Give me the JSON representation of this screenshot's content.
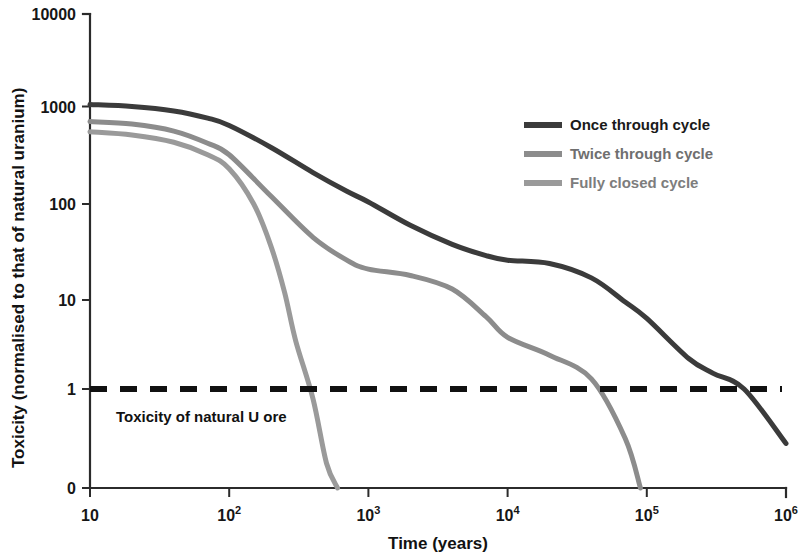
{
  "chart_data": {
    "type": "line",
    "title": "",
    "xlabel": "Time (years)",
    "ylabel": "Toxicity (normalised to that of natural uranium)",
    "x_scale": "log",
    "y_scale": "log-like (with 0 baseline)",
    "xlim": [
      10,
      1000000
    ],
    "ylim": [
      0,
      10000
    ],
    "grid": false,
    "legend_position": "upper-right-inside",
    "x_tick_labels": [
      "10",
      "10²",
      "10³",
      "10⁴",
      "10⁵",
      "10⁶"
    ],
    "x_tick_bases": [
      "10",
      "10",
      "10",
      "10",
      "10",
      "10"
    ],
    "x_tick_exponents": [
      "",
      "2",
      "3",
      "4",
      "5",
      "6"
    ],
    "x_tick_values": [
      10,
      100,
      1000,
      10000,
      100000,
      1000000
    ],
    "y_tick_labels": [
      "10000",
      "1000",
      "100",
      "10",
      "1",
      "0"
    ],
    "y_tick_values": [
      10000,
      1000,
      100,
      10,
      1,
      0
    ],
    "annotations": [
      {
        "name": "natural-uranium-ore-threshold",
        "text": "Toxicity of natural U ore",
        "y_value": 1,
        "style": "dashed-horizontal-line"
      }
    ],
    "series": [
      {
        "name": "Once through cycle",
        "color": "#3b3b3b",
        "stroke_width": 5,
        "x": [
          10,
          20,
          40,
          70,
          100,
          200,
          400,
          700,
          1000,
          2000,
          4000,
          7000,
          10000,
          20000,
          40000,
          70000,
          100000,
          200000,
          300000,
          500000,
          1000000
        ],
        "y": [
          1050,
          1000,
          900,
          760,
          640,
          380,
          210,
          135,
          105,
          60,
          38,
          29,
          26,
          24,
          17,
          9.5,
          6.2,
          2.2,
          1.5,
          1.0,
          0.45
        ]
      },
      {
        "name": "Twice through cycle",
        "color": "#8c8c8c",
        "stroke_width": 5,
        "x": [
          10,
          20,
          40,
          70,
          100,
          200,
          400,
          700,
          1000,
          2000,
          4000,
          7000,
          10000,
          20000,
          40000,
          70000,
          90000
        ],
        "y": [
          700,
          660,
          560,
          420,
          320,
          120,
          45,
          26,
          21,
          18,
          13,
          6.5,
          3.8,
          2.4,
          1.3,
          0.5,
          0
        ]
      },
      {
        "name": "Fully closed cycle",
        "color": "#9a9a9a",
        "stroke_width": 5,
        "x": [
          10,
          20,
          40,
          70,
          100,
          150,
          200,
          250,
          300,
          400,
          500,
          600
        ],
        "y": [
          550,
          510,
          430,
          320,
          230,
          100,
          36,
          12,
          3.5,
          0.9,
          0.25,
          0
        ]
      }
    ]
  },
  "legend": {
    "items": [
      {
        "label": "Once through cycle",
        "color": "#3b3b3b",
        "text_color": "#1a1a1a"
      },
      {
        "label": "Twice through cycle",
        "color": "#8c8c8c",
        "text_color": "#6f6f6f"
      },
      {
        "label": "Fully closed cycle",
        "color": "#9a9a9a",
        "text_color": "#7d7d7d"
      }
    ]
  },
  "colors": {
    "background": "#ffffff",
    "axis": "#2b2b2b",
    "text": "#161616",
    "once_through": "#3b3b3b",
    "twice_through": "#8c8c8c",
    "fully_closed": "#9a9a9a",
    "threshold": "#111111"
  }
}
